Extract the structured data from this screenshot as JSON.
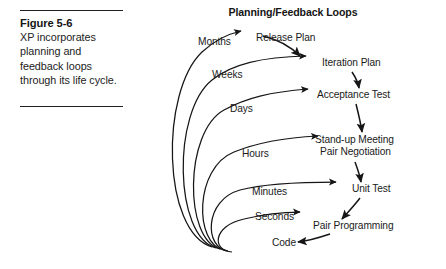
{
  "caption": {
    "figure_label": "Figure 5-6",
    "description": "XP incorporates planning and feedback loops through its life cycle."
  },
  "diagram": {
    "title": "Planning/Feedback Loops",
    "timescales": [
      {
        "label": "Months",
        "x": 198,
        "y": 45
      },
      {
        "label": "Weeks",
        "x": 212,
        "y": 78
      },
      {
        "label": "Days",
        "x": 230,
        "y": 112
      },
      {
        "label": "Hours",
        "x": 242,
        "y": 157
      },
      {
        "label": "Minutes",
        "x": 252,
        "y": 195
      },
      {
        "label": "Seconds",
        "x": 255,
        "y": 220
      },
      {
        "label": "Code",
        "x": 272,
        "y": 246
      }
    ],
    "activities": [
      {
        "label": "Release Plan",
        "x": 256,
        "y": 41
      },
      {
        "label": "Iteration Plan",
        "x": 322,
        "y": 66
      },
      {
        "label": "Acceptance Test",
        "x": 317,
        "y": 98
      },
      {
        "label": "Stand-up Meeting",
        "x": 315,
        "y": 143
      },
      {
        "label": "Pair Negotiation",
        "x": 320,
        "y": 155
      },
      {
        "label": "Unit Test",
        "x": 352,
        "y": 192
      },
      {
        "label": "Pair Programming",
        "x": 313,
        "y": 229
      }
    ],
    "colors": {
      "ink": "#161616",
      "rule": "#231f20",
      "background": "#ffffff"
    }
  }
}
